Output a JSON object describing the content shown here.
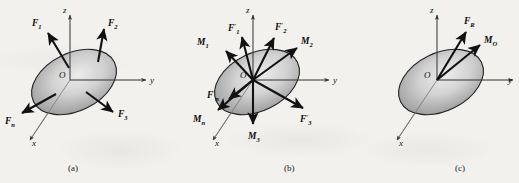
{
  "figure": {
    "background_color": "#f2f1ee",
    "body_shape": "tilted-ellipse-disc",
    "body_fill_light": "#e8e8e8",
    "body_fill_dark": "#8a8a8a",
    "vector_color": "#111111",
    "axis_color": "#333333"
  },
  "panels": [
    {
      "id": "a",
      "caption": "(a)",
      "origin_label": "O",
      "axes": [
        {
          "name": "z-axis",
          "label": "z",
          "direction": "up"
        },
        {
          "name": "y-axis",
          "label": "y",
          "direction": "right"
        },
        {
          "name": "x-axis",
          "label": "x",
          "direction": "down-left"
        }
      ],
      "vectors": [
        {
          "name": "force-F1",
          "label": "F",
          "sub": "1",
          "prime": false,
          "kind": "force",
          "direction": "up-left"
        },
        {
          "name": "force-F2",
          "label": "F",
          "sub": "2",
          "prime": false,
          "kind": "force",
          "direction": "up"
        },
        {
          "name": "force-F3",
          "label": "F",
          "sub": "3",
          "prime": false,
          "kind": "force",
          "direction": "down-right"
        },
        {
          "name": "force-Fn",
          "label": "F",
          "sub": "n",
          "prime": false,
          "kind": "force",
          "direction": "down-left"
        }
      ]
    },
    {
      "id": "b",
      "caption": "(b)",
      "origin_label": "O",
      "axes": [
        {
          "name": "z-axis",
          "label": "z",
          "direction": "up"
        },
        {
          "name": "y-axis",
          "label": "y",
          "direction": "right"
        },
        {
          "name": "x-axis",
          "label": "x",
          "direction": "down-left"
        }
      ],
      "vectors": [
        {
          "name": "force-F1-prime",
          "label": "F",
          "sub": "1",
          "prime": true,
          "kind": "force",
          "direction": "up-slightly-left"
        },
        {
          "name": "force-F2-prime",
          "label": "F",
          "sub": "2",
          "prime": true,
          "kind": "force",
          "direction": "up-right"
        },
        {
          "name": "force-F3-prime",
          "label": "F",
          "sub": "3",
          "prime": true,
          "kind": "force",
          "direction": "down-right"
        },
        {
          "name": "force-Fn-prime",
          "label": "F",
          "sub": "n",
          "prime": true,
          "kind": "force",
          "direction": "down-left"
        },
        {
          "name": "moment-M1",
          "label": "M",
          "sub": "1",
          "prime": false,
          "kind": "moment",
          "direction": "up-left"
        },
        {
          "name": "moment-M2",
          "label": "M",
          "sub": "2",
          "prime": false,
          "kind": "moment",
          "direction": "up-right"
        },
        {
          "name": "moment-M3",
          "label": "M",
          "sub": "3",
          "prime": false,
          "kind": "moment",
          "direction": "down"
        },
        {
          "name": "moment-Mn",
          "label": "M",
          "sub": "n",
          "prime": false,
          "kind": "moment",
          "direction": "down-left"
        }
      ]
    },
    {
      "id": "c",
      "caption": "(c)",
      "origin_label": "O",
      "axes": [
        {
          "name": "z-axis",
          "label": "z",
          "direction": "up"
        },
        {
          "name": "y-axis",
          "label": "y",
          "direction": "right"
        },
        {
          "name": "x-axis",
          "label": "x",
          "direction": "down-left"
        }
      ],
      "vectors": [
        {
          "name": "resultant-force-FR",
          "label": "F",
          "sub": "R",
          "prime": false,
          "kind": "force",
          "direction": "up-right"
        },
        {
          "name": "resultant-moment-MO",
          "label": "M",
          "sub": "O",
          "prime": false,
          "kind": "moment",
          "direction": "up-right-shallow"
        }
      ]
    }
  ],
  "labels": {
    "axis_z": "z",
    "axis_y": "y",
    "axis_x": "x",
    "origin": "O",
    "F": "F",
    "M": "M",
    "sub_1": "1",
    "sub_2": "2",
    "sub_3": "3",
    "sub_n": "n",
    "sub_R": "R",
    "sub_O": "O",
    "prime": "′",
    "caption_a": "(a)",
    "caption_b": "(b)",
    "caption_c": "(c)"
  }
}
